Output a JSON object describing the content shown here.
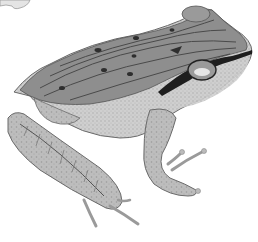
{
  "image": {
    "subject": "frog illustration",
    "style": "grayscale pencil drawing",
    "background": "#ffffff",
    "palette": {
      "dorsal": "#8a8a8a",
      "stripe": "#4a4a4a",
      "belly": "#c8c8c8",
      "limb": "#b4b4b4",
      "outline": "#555555",
      "dark_band": "#1e1e1e",
      "light": "#e6e6e6"
    }
  }
}
